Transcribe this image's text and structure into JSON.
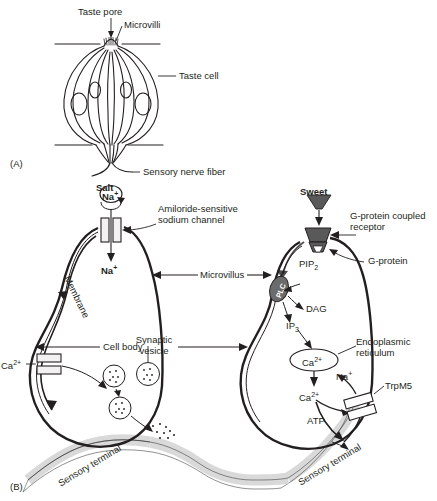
{
  "figure": {
    "panel_a": {
      "id": "(A)",
      "labels": {
        "taste_pore": "Taste pore",
        "microvilli": "Microvilli",
        "taste_cell": "Taste cell",
        "sensory_nerve_fiber": "Sensory nerve fiber"
      }
    },
    "panel_b": {
      "id": "(B)",
      "center_labels": {
        "microvillus": "Microvillus",
        "cell_body": "Cell body"
      },
      "left_cell": {
        "stimulus": "Salt",
        "stimulus_ion": "Na",
        "stimulus_ion_charge": "+",
        "channel_label_line1": "Amiloride-sensitive",
        "channel_label_line2": "sodium channel",
        "influx_ion": "Na",
        "influx_ion_charge": "+",
        "membrane": "Membrane",
        "calcium": "Ca",
        "calcium_charge": "2+",
        "vesicle_line1": "Synaptic",
        "vesicle_line2": "vesicle",
        "sensory_terminal": "Sensory terminal"
      },
      "right_cell": {
        "stimulus": "Sweet",
        "receptor_line1": "G-protein coupled",
        "receptor_line2": "receptor",
        "g_protein": "G-protein",
        "pip2": "PIP",
        "pip2_sub": "2",
        "plc": "PLC",
        "dag": "DAG",
        "ip3": "IP",
        "ip3_sub": "3",
        "er_calcium": "Ca",
        "er_calcium_charge": "2+",
        "er_line1": "Endoplasmic",
        "er_line2": "reticulum",
        "cyto_calcium": "Ca",
        "cyto_calcium_charge": "2+",
        "sodium": "Na",
        "sodium_charge": "+",
        "trpm5": "TrpM5",
        "atp": "ATP",
        "sensory_terminal": "Sensory terminal"
      }
    },
    "colors": {
      "ink": "#231f20",
      "terminal_fill": "#d9d9d9",
      "receptor_fill": "#595959",
      "plc_fill": "#6b6b6b",
      "channel_fill": "#f2f2f2",
      "background": "#ffffff"
    }
  }
}
